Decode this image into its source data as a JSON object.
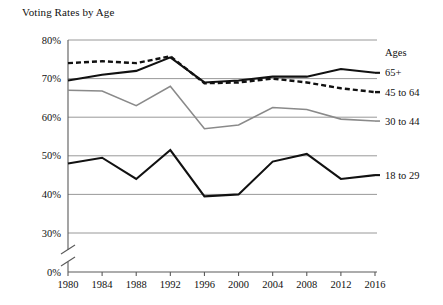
{
  "chart_data": {
    "type": "line",
    "title": "Voting Rates by Age",
    "xlabel": "",
    "ylabel": "",
    "x": [
      1980,
      1984,
      1988,
      1992,
      1996,
      2000,
      2004,
      2008,
      2012,
      2016
    ],
    "xtick_labels": [
      "1980",
      "1984",
      "1988",
      "1992",
      "1996",
      "2000",
      "2004",
      "2008",
      "2012",
      "2016"
    ],
    "ytick_labels": [
      "80%",
      "70%",
      "60%",
      "50%",
      "40%",
      "30%",
      "0%"
    ],
    "ytick_values": [
      80,
      70,
      60,
      50,
      40,
      30,
      0
    ],
    "ylim": [
      30,
      80
    ],
    "axis_break": true,
    "axis_break_note": "y-axis broken between 0% and 30%",
    "grid": "horizontal",
    "legend_position": "right",
    "legend_title": "Ages",
    "series": [
      {
        "name": "65+",
        "style": "solid-dark",
        "color": "#111111",
        "values": [
          69.5,
          71.0,
          72.0,
          75.5,
          69.0,
          69.5,
          70.5,
          70.5,
          72.5,
          71.5
        ]
      },
      {
        "name": "45 to 64",
        "style": "dashed-dark",
        "color": "#111111",
        "values": [
          74.0,
          74.5,
          74.0,
          75.8,
          68.8,
          69.0,
          70.0,
          69.0,
          67.5,
          66.5
        ]
      },
      {
        "name": "30 to 44",
        "style": "solid-gray",
        "color": "#8a8a8a",
        "values": [
          67.0,
          66.8,
          63.0,
          68.0,
          57.0,
          58.0,
          62.5,
          62.0,
          59.5,
          59.0
        ]
      },
      {
        "name": "18 to 29",
        "style": "solid-dark",
        "color": "#111111",
        "values": [
          48.0,
          49.5,
          44.0,
          51.5,
          39.5,
          40.0,
          48.5,
          50.5,
          44.0,
          45.0
        ]
      }
    ]
  }
}
